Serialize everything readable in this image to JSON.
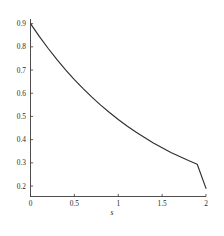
{
  "chart_data": {
    "type": "line",
    "title": "",
    "subtitle": "",
    "xlabel": "s",
    "ylabel": "",
    "xlim": [
      0,
      2
    ],
    "ylim": [
      0.155,
      0.92
    ],
    "grid": false,
    "legend": null,
    "x_ticks": [
      0,
      0.5,
      1,
      1.5,
      2
    ],
    "x_tick_labels": [
      "0",
      "0.5",
      "1",
      "1.5",
      "2"
    ],
    "y_ticks": [
      0.2,
      0.3,
      0.4,
      0.5,
      0.6,
      0.7,
      0.8,
      0.9
    ],
    "y_tick_labels": [
      "0.2",
      "0.3",
      "0.4",
      "0.5",
      "0.6",
      "0.7",
      "0.8",
      "0.9"
    ],
    "series": [
      {
        "name": "decay-curve",
        "color": "#2f2f2f",
        "x": [
          0,
          0.1,
          0.2,
          0.3,
          0.4,
          0.5,
          0.6,
          0.7,
          0.8,
          0.9,
          1.0,
          1.1,
          1.2,
          1.3,
          1.4,
          1.5,
          1.6,
          1.7,
          1.8,
          1.9,
          2.0
        ],
        "values": [
          0.9,
          0.845,
          0.794,
          0.746,
          0.701,
          0.659,
          0.62,
          0.583,
          0.549,
          0.517,
          0.487,
          0.459,
          0.433,
          0.409,
          0.386,
          0.365,
          0.345,
          0.327,
          0.31,
          0.294,
          0.19
        ]
      }
    ],
    "axis_style": {
      "x_axis_color": "#3a3a3a",
      "y_axis_color": "#3a3a3a",
      "background": "#ffffff"
    }
  },
  "figure": {
    "name": "exponential-decay-plot"
  }
}
